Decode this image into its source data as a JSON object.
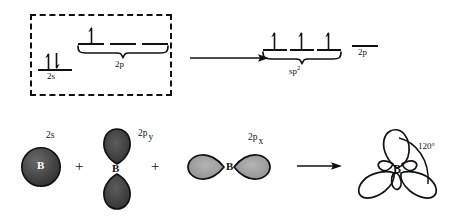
{
  "diagram": {
    "colors": {
      "ink": "#111111",
      "orbital_dark": "#3a3a3a",
      "orbital_light": "#9a9a9a",
      "background": "#ffffff"
    }
  },
  "top_row": {
    "ground_state": {
      "boxed": true,
      "levels": [
        {
          "id": "2s",
          "label": "2s",
          "orbitals": 1,
          "electrons": [
            "up",
            "down"
          ]
        },
        {
          "id": "2p",
          "label": "2p",
          "orbitals": 3,
          "electrons": [
            "up",
            "",
            ""
          ]
        }
      ]
    },
    "arrow": {
      "name": "reaction-arrow",
      "direction": "right"
    },
    "hybrid_state": {
      "levels": [
        {
          "id": "sp2",
          "label": "sp2",
          "label_base": "sp",
          "label_sup": "2",
          "orbitals": 3,
          "electrons": [
            "up",
            "up",
            "up"
          ]
        },
        {
          "id": "2p",
          "label": "2p",
          "orbitals": 1,
          "electrons": [
            ""
          ]
        }
      ]
    }
  },
  "bottom_row": {
    "items": [
      {
        "id": "2s-orbital",
        "label": "2s",
        "label_base": "2s",
        "label_sub": "",
        "shape": "sphere",
        "atom": "B"
      },
      {
        "id": "2py-orbital",
        "label": "2p y",
        "label_base": "2p",
        "label_sub": "y",
        "shape": "dumbbell-vertical",
        "atom": "B"
      },
      {
        "id": "2px-orbital",
        "label": "2p x",
        "label_base": "2p",
        "label_sub": "x",
        "shape": "dumbbell-horizontal",
        "atom": "B"
      }
    ],
    "operators": [
      "+",
      "+"
    ],
    "arrow": {
      "name": "reaction-arrow",
      "direction": "right"
    },
    "result": {
      "id": "sp2-hybrid",
      "atom": "B",
      "shape": "trigonal-planar",
      "lobes": 3,
      "angle_label": "120°"
    }
  }
}
